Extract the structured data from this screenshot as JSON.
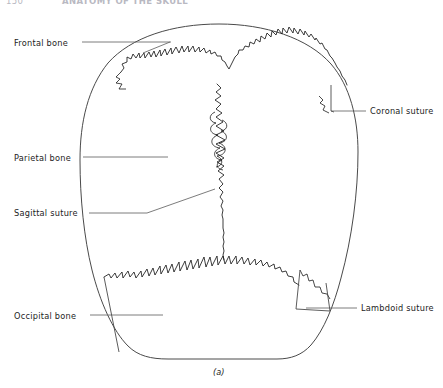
{
  "page": {
    "running_head": {
      "folio": "150",
      "title": "ANATOMY OF THE SKULL"
    },
    "caption": "(a)"
  },
  "figure": {
    "view": "superior view of skull",
    "labels": [
      {
        "id": "frontal-bone",
        "text": "Frontal bone",
        "x": 14,
        "y": 38,
        "align": "left"
      },
      {
        "id": "coronal-suture",
        "text": "Coronal suture",
        "x": 370,
        "y": 108,
        "align": "left"
      },
      {
        "id": "parietal-bone",
        "text": "Parietal bone",
        "x": 14,
        "y": 153,
        "align": "left"
      },
      {
        "id": "sagittal-suture",
        "text": "Sagittal suture",
        "x": 14,
        "y": 206,
        "align": "left"
      },
      {
        "id": "occipital-bone",
        "text": "Occipital bone",
        "x": 14,
        "y": 311,
        "align": "left"
      },
      {
        "id": "lambdoid-suture",
        "text": "Lambdoid suture",
        "x": 361,
        "y": 304,
        "align": "left"
      }
    ],
    "colors": {
      "outline": "#4a4a4a",
      "suture": "#1a1a1a",
      "leader": "#5a5a5a",
      "text": "#1d1d1d",
      "running_head": "#b9b9c2",
      "background": "#ffffff"
    }
  }
}
